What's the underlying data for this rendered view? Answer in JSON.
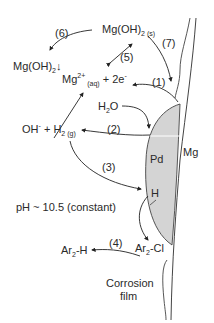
{
  "diagram": {
    "species": {
      "mgoh2_s": {
        "main": "Mg(OH)",
        "sub": "2 (s)"
      },
      "mgoh2_precip": {
        "main": "Mg(OH)",
        "sub": "2",
        "tail": "↓"
      },
      "mg2_aq": {
        "main": "Mg",
        "sup": "2+",
        "sub": " (aq)",
        "tail": " + 2e",
        "sup2": "-"
      },
      "h2o": {
        "main": "H",
        "sub": "2",
        "tail": "O"
      },
      "oh_h2": {
        "main": "OH",
        "sup": "-",
        "mid": " + H",
        "sub": "2 (g)"
      },
      "pd": "Pd",
      "h": "H",
      "mg": "Mg",
      "ar2cl": {
        "a": "Ar",
        "sub": "2",
        "b": "-Cl"
      },
      "ar2h": {
        "a": "Ar",
        "sub": "2",
        "b": "-H"
      },
      "corrosion_film": [
        "Corrosion",
        "film"
      ]
    },
    "steps": [
      "(1)",
      "(2)",
      "(3)",
      "(4)",
      "(5)",
      "(6)",
      "(7)"
    ],
    "condition": "pH ~ 10.5 (constant)",
    "colors": {
      "pd_fill": "#d4d4d4",
      "line": "#3a3a3a"
    }
  }
}
